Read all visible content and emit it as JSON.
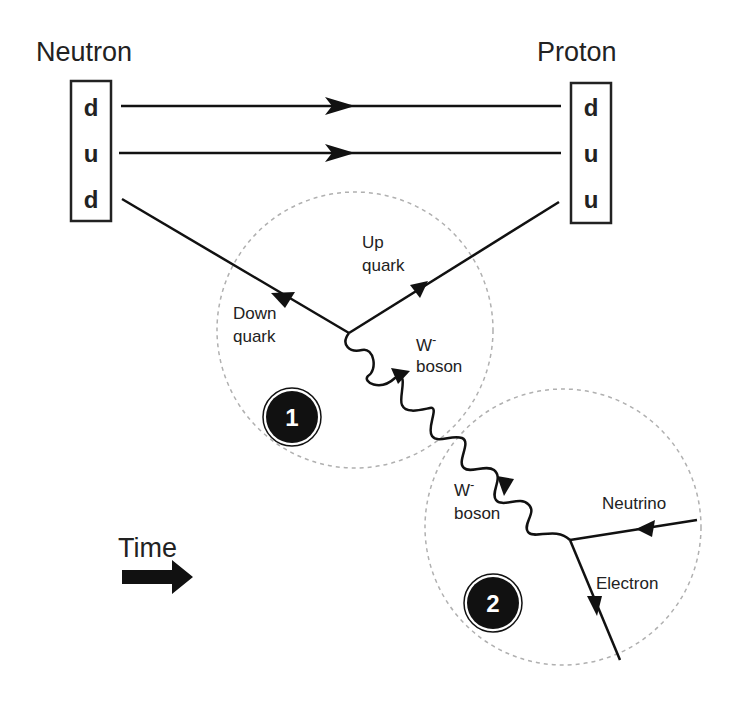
{
  "diagram": {
    "neutron": {
      "label": "Neutron",
      "quarks": [
        "d",
        "u",
        "d"
      ]
    },
    "proton": {
      "label": "Proton",
      "quarks": [
        "d",
        "u",
        "u"
      ]
    },
    "vertex1": {
      "number": "1",
      "incoming_label_line1": "Down",
      "incoming_label_line2": "quark",
      "outgoing_label_line1": "Up",
      "outgoing_label_line2": "quark",
      "boson_label_line1": "W",
      "boson_label_sup": "-",
      "boson_label_line2": "boson"
    },
    "vertex2": {
      "number": "2",
      "boson_label_line1": "W",
      "boson_label_sup": "-",
      "boson_label_line2": "boson",
      "neutrino_label": "Neutrino",
      "electron_label": "Electron"
    },
    "time": {
      "label": "Time",
      "arrow": "right-arrow-icon"
    },
    "colors": {
      "line": "#111111",
      "circle_dash": "#b0b0b0",
      "badge": "#111111"
    }
  }
}
